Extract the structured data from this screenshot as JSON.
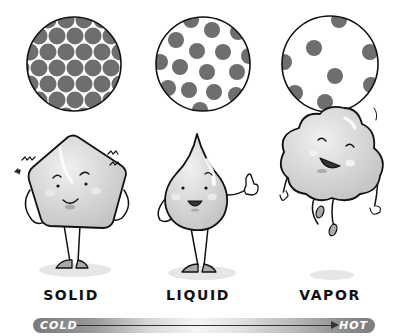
{
  "states": [
    {
      "id": "solid",
      "label": "SOLID",
      "particle_arrangement": "tightly packed",
      "character": "ice cube",
      "expression": "shivering"
    },
    {
      "id": "liquid",
      "label": "LIQUID",
      "particle_arrangement": "loosely packed",
      "character": "water drop",
      "expression": "thumbs up"
    },
    {
      "id": "vapor",
      "label": "VAPOR",
      "particle_arrangement": "widely spaced",
      "character": "cloud",
      "expression": "floating"
    }
  ],
  "temperature_scale": {
    "start_label": "COLD",
    "end_label": "HOT"
  },
  "colors": {
    "particle": "#6e6e6e",
    "outline": "#111111",
    "body_fill": "#d4d4d4",
    "shadow": "#e6e6e6",
    "bar_dark": "#7a7a7a",
    "bar_light": "#f4f4f4"
  }
}
